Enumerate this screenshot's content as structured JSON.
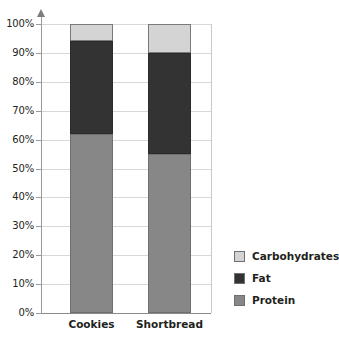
{
  "chart_data": {
    "type": "bar",
    "subtype": "stacked-percentage",
    "title": "",
    "xlabel": "",
    "ylabel": "",
    "categories": [
      "Cookies",
      "Shortbread"
    ],
    "series": [
      {
        "name": "Protein",
        "values": [
          62,
          55
        ],
        "color": "#878787"
      },
      {
        "name": "Fat",
        "values": [
          32,
          35
        ],
        "color": "#333333"
      },
      {
        "name": "Carbohydrates",
        "values": [
          6,
          10
        ],
        "color": "#d4d4d4"
      }
    ],
    "stack_order_bottom_to_top": [
      "Protein",
      "Fat",
      "Carbohydrates"
    ],
    "ylim": [
      0,
      100
    ],
    "ytick_labels": [
      "0%",
      "10%",
      "20%",
      "30%",
      "40%",
      "50%",
      "60%",
      "70%",
      "80%",
      "90%",
      "100%"
    ],
    "ytick_values": [
      0,
      10,
      20,
      30,
      40,
      50,
      60,
      70,
      80,
      90,
      100
    ],
    "grid": true,
    "legend_position": "right",
    "legend": [
      "Carbohydrates",
      "Fat",
      "Protein"
    ],
    "axis_color": "#9a9a9a",
    "grid_color": "#d8d8d8",
    "background": "#ffffff"
  },
  "axis": {
    "y_arrow_icon": "axis-arrow-up-icon"
  }
}
